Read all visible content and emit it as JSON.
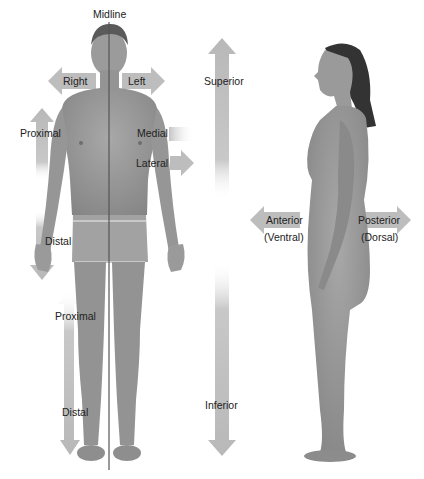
{
  "labels": {
    "midline": "Midline",
    "right": "Right",
    "left": "Left",
    "superior": "Superior",
    "inferior": "Inferior",
    "proximal_arm": "Proximal",
    "distal_arm": "Distal",
    "medial": "Medial",
    "lateral": "Lateral",
    "proximal_leg": "Proximal",
    "distal_leg": "Distal",
    "anterior": "Anterior",
    "ventral": "(Ventral)",
    "posterior": "Posterior",
    "dorsal": "(Dorsal)"
  },
  "colors": {
    "arrow": "#bdbdbd",
    "skin": "#9a9a9a",
    "skin_dark": "#7d7d7d",
    "hair": "#3a3a3a",
    "midline": "#555555"
  }
}
